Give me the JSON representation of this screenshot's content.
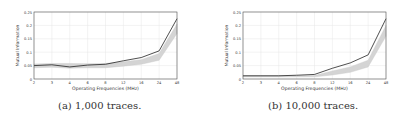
{
  "chart_data": [
    {
      "type": "line",
      "panel": "a",
      "caption": "(a) 1,000 traces.",
      "title": "",
      "xlabel": "Operating Frequencies (MHz)",
      "ylabel": "Mutual Information",
      "categories": [
        "2",
        "3",
        "4",
        "6",
        "8",
        "12",
        "16",
        "24",
        "48"
      ],
      "yticks": [
        "0",
        "0.05",
        "0.1",
        "0.15",
        "0.2",
        "0.25"
      ],
      "ylim": [
        0,
        0.25
      ],
      "grid": true,
      "series": [
        {
          "name": "mean",
          "color": "#222222",
          "values": [
            0.05,
            0.053,
            0.045,
            0.052,
            0.055,
            0.068,
            0.08,
            0.105,
            0.225
          ]
        },
        {
          "name": "band_upper",
          "color": "#cccccc",
          "values": [
            0.056,
            0.058,
            0.058,
            0.057,
            0.058,
            0.064,
            0.072,
            0.095,
            0.205
          ]
        },
        {
          "name": "band_lower",
          "color": "#cccccc",
          "values": [
            0.042,
            0.044,
            0.04,
            0.042,
            0.042,
            0.048,
            0.055,
            0.07,
            0.17
          ]
        }
      ]
    },
    {
      "type": "line",
      "panel": "b",
      "caption": "(b) 10,000 traces.",
      "title": "",
      "xlabel": "Operating Frequencies (MHz)",
      "ylabel": "Mutual Information",
      "categories": [
        "2",
        "3",
        "4",
        "6",
        "8",
        "12",
        "16",
        "24",
        "48"
      ],
      "yticks": [
        "0",
        "0.05",
        "0.1",
        "0.15",
        "0.2",
        "0.25"
      ],
      "ylim": [
        0,
        0.25
      ],
      "grid": true,
      "series": [
        {
          "name": "mean",
          "color": "#222222",
          "values": [
            0.012,
            0.012,
            0.012,
            0.014,
            0.017,
            0.04,
            0.06,
            0.09,
            0.225
          ]
        },
        {
          "name": "band_upper",
          "color": "#cccccc",
          "values": [
            0.012,
            0.012,
            0.012,
            0.012,
            0.013,
            0.03,
            0.045,
            0.07,
            0.2
          ]
        },
        {
          "name": "band_lower",
          "color": "#cccccc",
          "values": [
            0.008,
            0.008,
            0.008,
            0.008,
            0.008,
            0.015,
            0.025,
            0.045,
            0.16
          ]
        }
      ]
    }
  ]
}
